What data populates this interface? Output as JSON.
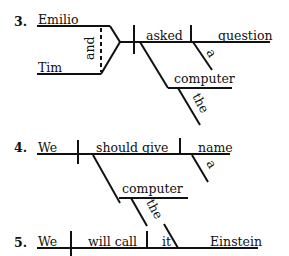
{
  "diagrams": [
    {
      "number": "3.",
      "subjects": [
        "Emilio",
        "Tim"
      ],
      "conjunction": "and",
      "verb": "asked",
      "direct_object": "question",
      "direct_object_modifier": "a",
      "indirect_object": "computer",
      "indirect_object_modifier": "the"
    },
    {
      "number": "4.",
      "subject": "We",
      "verb": "should give",
      "direct_object": "name",
      "direct_object_modifier": "a",
      "indirect_object": "computer",
      "indirect_object_modifier": "the"
    },
    {
      "number": "5.",
      "subject": "We",
      "verb": "will call",
      "direct_object": "it",
      "object_complement": "Einstein"
    }
  ]
}
